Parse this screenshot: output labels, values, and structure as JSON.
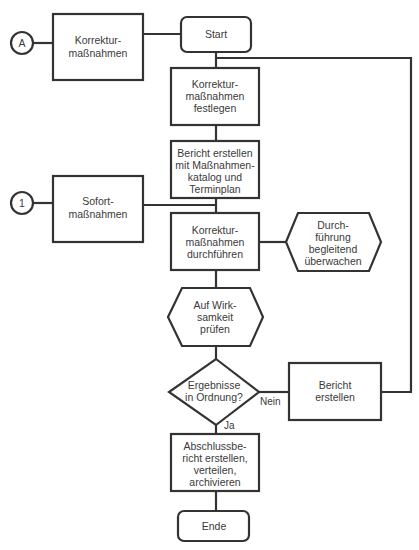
{
  "diagram": {
    "type": "flowchart",
    "colors": {
      "stroke": "#333333",
      "fill": "#ffffff",
      "text": "#3a3a3a"
    },
    "connectors": {
      "A": "A",
      "one": "1"
    },
    "nodes": {
      "korrektur": [
        "Korrektur-",
        "maßnahmen"
      ],
      "start": [
        "Start"
      ],
      "festlegen": [
        "Korrektur-",
        "maßnahmen",
        "festlegen"
      ],
      "bericht_katalog": [
        "Bericht erstellen",
        "mit Maßnahmen-",
        "katalog und",
        "Terminplan"
      ],
      "sofort": [
        "Sofort-",
        "maßnahmen"
      ],
      "durchfuehren": [
        "Korrektur-",
        "maßnahmen",
        "durchführen"
      ],
      "ueberwachen": [
        "Durch-",
        "führung",
        "begleitend",
        "überwachen"
      ],
      "wirksamkeit": [
        "Auf Wirk-",
        "samkeit",
        "prüfen"
      ],
      "ergebnisse": [
        "Ergebnisse",
        "in Ordnung?"
      ],
      "bericht": [
        "Bericht",
        "erstellen"
      ],
      "abschluss": [
        "Abschlussbe-",
        "richt erstellen,",
        "verteilen,",
        "archivieren"
      ],
      "ende": [
        "Ende"
      ]
    },
    "edge_labels": {
      "no": "Nein",
      "yes": "Ja"
    }
  }
}
